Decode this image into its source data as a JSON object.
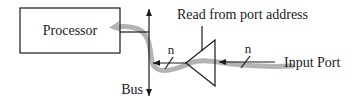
{
  "diagram": {
    "type": "block-diagram",
    "nodes": {
      "processor": {
        "label": "Processor"
      },
      "bus": {
        "label": "Bus"
      },
      "buffer": {
        "label": "Read from port address",
        "kind": "tri-state buffer"
      },
      "input_port": {
        "label": "Input Port"
      }
    },
    "edges": [
      {
        "from": "input_port",
        "to": "buffer",
        "width_label": "n"
      },
      {
        "from": "buffer",
        "to": "bus",
        "width_label": "n"
      },
      {
        "from": "bus",
        "to": "processor"
      }
    ],
    "data_flow": {
      "description": "Data flows from the Input Port through the buffer onto the bus and into the Processor",
      "color": "#b3b3b3"
    },
    "colors": {
      "line": "#1a1a1a",
      "flow": "#b3b3b3",
      "background": "#ffffff"
    }
  }
}
